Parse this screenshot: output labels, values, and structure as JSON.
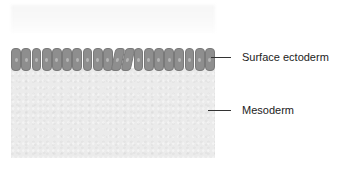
{
  "figure": {
    "layers": [
      {
        "name": "Surface ectoderm",
        "color": "#8e8e8e",
        "cell_count": 20
      },
      {
        "name": "Mesoderm",
        "color": "#ebebeb"
      }
    ]
  },
  "labels": {
    "surface_ectoderm": "Surface ectoderm",
    "mesoderm": "Mesoderm"
  }
}
